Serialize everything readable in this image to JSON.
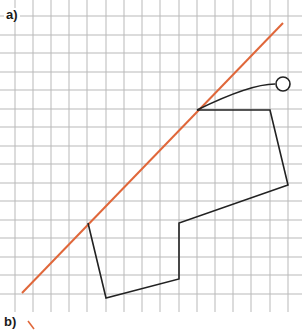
{
  "diagram": {
    "type": "grid-drawing",
    "parts": [
      {
        "label": "a)"
      },
      {
        "label": "b)"
      }
    ],
    "grid": {
      "color": "#b9b9b9",
      "x_lines": [
        15,
        33,
        51,
        69,
        87,
        106,
        124,
        142,
        160,
        179,
        197,
        215,
        233,
        251,
        270,
        288
      ],
      "y_lines": [
        16,
        35,
        53,
        72,
        90,
        109,
        127,
        146,
        164,
        183,
        201,
        220,
        238,
        257,
        275,
        294
      ],
      "x_extent": [
        0,
        302
      ],
      "y_extent": [
        0,
        312
      ]
    },
    "mirror_line": {
      "color": "#e0673a",
      "from": [
        22,
        293
      ],
      "to": [
        283,
        23
      ]
    },
    "shape": {
      "color": "#222222",
      "polyline": [
        [
          197,
          110
        ],
        [
          270,
          110
        ],
        [
          288,
          185
        ],
        [
          179,
          223
        ],
        [
          179,
          279
        ],
        [
          106,
          298
        ],
        [
          88,
          223
        ]
      ],
      "curve": {
        "from": [
          197,
          110
        ],
        "control": [
          250,
          84
        ],
        "to": [
          275,
          84
        ]
      },
      "circle": {
        "cx": 283,
        "cy": 84,
        "r": 7
      }
    },
    "part_b_mark": {
      "color": "#e0673a",
      "from": [
        28,
        321
      ],
      "to": [
        34,
        329
      ]
    }
  }
}
